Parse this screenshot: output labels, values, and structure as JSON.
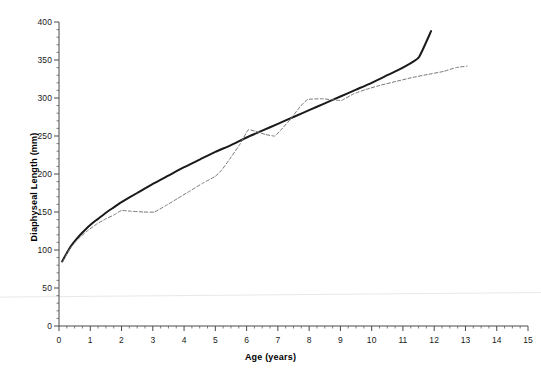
{
  "chart_data": {
    "type": "line",
    "title": "",
    "xlabel": "Age (years)",
    "ylabel": "Diaphyseal Length (mm)",
    "xlim": [
      0,
      15
    ],
    "ylim": [
      0,
      400
    ],
    "xticks": [
      0,
      1,
      2,
      3,
      4,
      5,
      6,
      7,
      8,
      9,
      10,
      11,
      12,
      13,
      14,
      15
    ],
    "xtick_labels": [
      "0",
      "1",
      "2",
      "3",
      "4",
      "5",
      "6",
      "7",
      "8",
      "9",
      "10",
      "11",
      "12",
      "13",
      "14",
      "15"
    ],
    "x_minor_tick_interval": 0.25,
    "yticks": [
      0,
      50,
      100,
      150,
      200,
      250,
      300,
      350,
      400
    ],
    "ytick_labels": [
      "0",
      "50",
      "100",
      "150",
      "200",
      "250",
      "300",
      "350",
      "400"
    ],
    "y_minor_tick_interval": 10,
    "grid": false,
    "legend": "none",
    "series": [
      {
        "name": "solid-reference-curve",
        "style": "solid",
        "color": "#1a1a1a",
        "width": 2.0,
        "points": [
          [
            0.1,
            85
          ],
          [
            0.25,
            96
          ],
          [
            0.4,
            106
          ],
          [
            0.55,
            114
          ],
          [
            0.75,
            123
          ],
          [
            1.0,
            133
          ],
          [
            1.25,
            141
          ],
          [
            1.5,
            149
          ],
          [
            1.75,
            156
          ],
          [
            2.0,
            163
          ],
          [
            2.5,
            175
          ],
          [
            3.0,
            187
          ],
          [
            3.5,
            198
          ],
          [
            4.0,
            209
          ],
          [
            4.5,
            219
          ],
          [
            5.0,
            229
          ],
          [
            5.5,
            238
          ],
          [
            6.0,
            248
          ],
          [
            6.5,
            257
          ],
          [
            7.0,
            266
          ],
          [
            7.5,
            275
          ],
          [
            8.0,
            284
          ],
          [
            8.5,
            293
          ],
          [
            9.0,
            302
          ],
          [
            9.5,
            311
          ],
          [
            10.0,
            320
          ],
          [
            10.5,
            330
          ],
          [
            11.0,
            340
          ],
          [
            11.5,
            353
          ],
          [
            11.9,
            388
          ]
        ]
      },
      {
        "name": "dashed-individual-curve",
        "style": "dashed",
        "color": "#777777",
        "width": 1.0,
        "dasharray": "3.2 2.2",
        "points": [
          [
            0.12,
            85
          ],
          [
            0.35,
            102
          ],
          [
            0.6,
            114
          ],
          [
            0.9,
            125
          ],
          [
            1.2,
            134
          ],
          [
            1.5,
            141
          ],
          [
            1.75,
            146
          ],
          [
            2.0,
            152
          ],
          [
            2.3,
            151
          ],
          [
            2.7,
            150
          ],
          [
            3.05,
            150
          ],
          [
            3.4,
            158
          ],
          [
            3.8,
            168
          ],
          [
            4.2,
            178
          ],
          [
            4.6,
            188
          ],
          [
            5.0,
            197
          ],
          [
            5.2,
            205
          ],
          [
            5.5,
            222
          ],
          [
            5.8,
            240
          ],
          [
            6.05,
            258
          ],
          [
            6.3,
            256
          ],
          [
            6.6,
            252
          ],
          [
            6.9,
            250
          ],
          [
            7.1,
            258
          ],
          [
            7.4,
            272
          ],
          [
            7.7,
            288
          ],
          [
            7.95,
            298
          ],
          [
            8.4,
            299
          ],
          [
            8.9,
            297
          ],
          [
            9.05,
            297
          ],
          [
            9.4,
            305
          ],
          [
            9.8,
            311
          ],
          [
            10.3,
            317
          ],
          [
            10.8,
            322
          ],
          [
            11.3,
            327
          ],
          [
            11.8,
            331
          ],
          [
            12.3,
            335
          ],
          [
            12.7,
            340
          ],
          [
            13.05,
            342
          ]
        ]
      }
    ],
    "artifact_line": {
      "name": "scan-artifact-hairline",
      "color": "#e8e8e8",
      "y_left_mm": 38,
      "y_right_mm": 44
    }
  }
}
